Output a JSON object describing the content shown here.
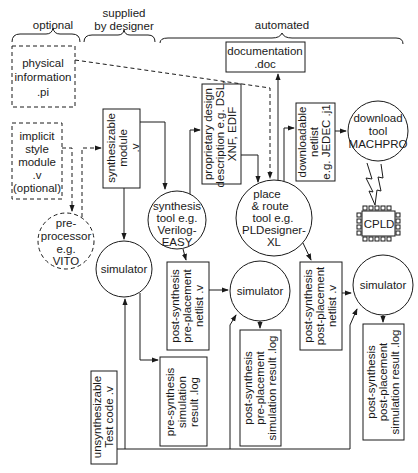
{
  "headers": {
    "optional": "optional",
    "supplied_line1": "supplied",
    "supplied_line2": "by designer",
    "automated": "automated"
  },
  "nodes": {
    "physical_info": [
      "physical",
      "information",
      ".pi"
    ],
    "implicit_style": [
      "implicit",
      "style",
      "module",
      ".v",
      "(optional)"
    ],
    "preprocessor": [
      "pre-",
      "processor",
      "e.g.",
      "VITO"
    ],
    "synth_module": [
      "synthesizable",
      "module",
      ".v"
    ],
    "simulator1": "simulator",
    "synthesis_tool": [
      "synthesis",
      "tool e.g.",
      "Verilog-",
      "EASY"
    ],
    "proprietary": [
      "proprietary design",
      "description e.g. DSL,",
      "XNF, EDIF"
    ],
    "documentation": [
      "documentation",
      ".doc"
    ],
    "place_route": [
      "place",
      "& route",
      "tool e.g.",
      "PLDesigner-",
      "XL"
    ],
    "downloadable": [
      "downloadable",
      "netlist",
      "e.g. JEDEC .j1"
    ],
    "download_tool": [
      "download",
      "tool",
      "MACHPRO"
    ],
    "cpld": "CPLD",
    "post_pre_netlist": [
      "post-synthesis",
      "pre-placement",
      "netlist .v"
    ],
    "simulator2": "simulator",
    "post_post_netlist": [
      "post-synthesis",
      "post-placement",
      "netlist .v"
    ],
    "simulator3": "simulator",
    "pre_synth_log": [
      "pre-synthesis",
      "simulation",
      "result .log"
    ],
    "post_pre_log": [
      "post-synthesis",
      "pre-placement",
      "simulation result .log"
    ],
    "post_post_log": [
      "post-synthesis",
      "post-placement",
      "simulation result .log"
    ],
    "test_code": [
      "unsynthesizable",
      "Test code .v"
    ]
  },
  "colors": {
    "stroke": "#1a1a1a",
    "background": "#ffffff"
  }
}
